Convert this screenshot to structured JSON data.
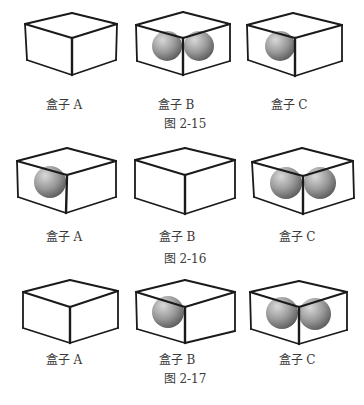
{
  "figures": [
    {
      "caption": "图 2-15",
      "caption_pos": [
        185,
        122
      ],
      "boxes": [
        {
          "label": "盒子 A",
          "label_pos": [
            64,
            103
          ],
          "pts": {
            "top": [
              72,
              13
            ],
            "lt": [
              25,
              24
            ],
            "rt": [
              117,
              24
            ],
            "c": [
              72,
              38
            ],
            "lb": [
              27,
              60
            ],
            "cb": [
              72,
              75
            ],
            "rb": [
              116,
              60
            ]
          },
          "balls": []
        },
        {
          "label": "盒子 B",
          "label_pos": [
            176,
            103
          ],
          "pts": {
            "top": [
              183,
              12
            ],
            "lt": [
              136,
              25
            ],
            "rt": [
              230,
              24
            ],
            "c": [
              183,
              38
            ],
            "lb": [
              137,
              61
            ],
            "cb": [
              183,
              75
            ],
            "rb": [
              230,
              61
            ]
          },
          "balls": [
            [
              167,
              46,
              15
            ],
            [
              199,
              46,
              15
            ]
          ]
        },
        {
          "label": "盒子 C",
          "label_pos": [
            289,
            103
          ],
          "pts": {
            "top": [
              293,
              13
            ],
            "lt": [
              247,
              25
            ],
            "rt": [
              342,
              25
            ],
            "c": [
              295,
              38
            ],
            "lb": [
              248,
              60
            ],
            "cb": [
              295,
              76
            ],
            "rb": [
              342,
              61
            ]
          },
          "balls": [
            [
              280,
              46,
              15
            ]
          ]
        }
      ]
    },
    {
      "caption": "图 2-16",
      "caption_pos": [
        185,
        257
      ],
      "boxes": [
        {
          "label": "盒子 A",
          "label_pos": [
            64,
            235
          ],
          "pts": {
            "top": [
              67,
              148
            ],
            "lt": [
              17,
              161
            ],
            "rt": [
              116,
              161
            ],
            "c": [
              67,
              175
            ],
            "lb": [
              18,
              197
            ],
            "cb": [
              66,
              213
            ],
            "rb": [
              116,
              197
            ]
          },
          "balls": [
            [
              50,
              182,
              16
            ]
          ]
        },
        {
          "label": "盒子 B",
          "label_pos": [
            177,
            235
          ],
          "pts": {
            "top": [
              185,
              148
            ],
            "lt": [
              135,
              160
            ],
            "rt": [
              235,
              160
            ],
            "c": [
              185,
              175
            ],
            "lb": [
              135,
              198
            ],
            "cb": [
              185,
              214
            ],
            "rb": [
              235,
              198
            ]
          },
          "balls": []
        },
        {
          "label": "盒子 C",
          "label_pos": [
            297,
            235
          ],
          "pts": {
            "top": [
              302,
              148
            ],
            "lt": [
              252,
              162
            ],
            "rt": [
              353,
              161
            ],
            "c": [
              303,
              176
            ],
            "lb": [
              254,
              197
            ],
            "cb": [
              303,
              214
            ],
            "rb": [
              354,
              198
            ]
          },
          "balls": [
            [
              286,
              183,
              16
            ],
            [
              320,
              183,
              16
            ]
          ]
        }
      ]
    },
    {
      "caption": "图 2-17",
      "caption_pos": [
        185,
        377
      ],
      "boxes": [
        {
          "label": "盒子 A",
          "label_pos": [
            64,
            358
          ],
          "pts": {
            "top": [
              70,
              280
            ],
            "lt": [
              23,
              292
            ],
            "rt": [
              118,
              291
            ],
            "c": [
              70,
              307
            ],
            "lb": [
              23,
              328
            ],
            "cb": [
              70,
              343
            ],
            "rb": [
              118,
              328
            ]
          },
          "balls": []
        },
        {
          "label": "盒子 B",
          "label_pos": [
            177,
            358
          ],
          "pts": {
            "top": [
              185,
              280
            ],
            "lt": [
              136,
              292
            ],
            "rt": [
              235,
              292
            ],
            "c": [
              185,
              307
            ],
            "lb": [
              137,
              329
            ],
            "cb": [
              185,
              343
            ],
            "rb": [
              235,
              331
            ]
          },
          "balls": [
            [
              168,
              312,
              16
            ]
          ]
        },
        {
          "label": "盒子 C",
          "label_pos": [
            297,
            358
          ],
          "pts": {
            "top": [
              299,
              281
            ],
            "lt": [
              250,
              292
            ],
            "rt": [
              347,
              292
            ],
            "c": [
              299,
              307
            ],
            "lb": [
              251,
              329
            ],
            "cb": [
              299,
              344
            ],
            "rb": [
              347,
              330
            ]
          },
          "balls": [
            [
              282,
              313,
              16
            ],
            [
              315,
              314,
              16
            ]
          ]
        }
      ]
    }
  ],
  "colors": {
    "edge": "#1a1a1a",
    "ball_light": "#d4d4d4",
    "ball_mid": "#9a9a9a",
    "ball_dark": "#5e5e5e",
    "text": "#3a3a3a"
  }
}
